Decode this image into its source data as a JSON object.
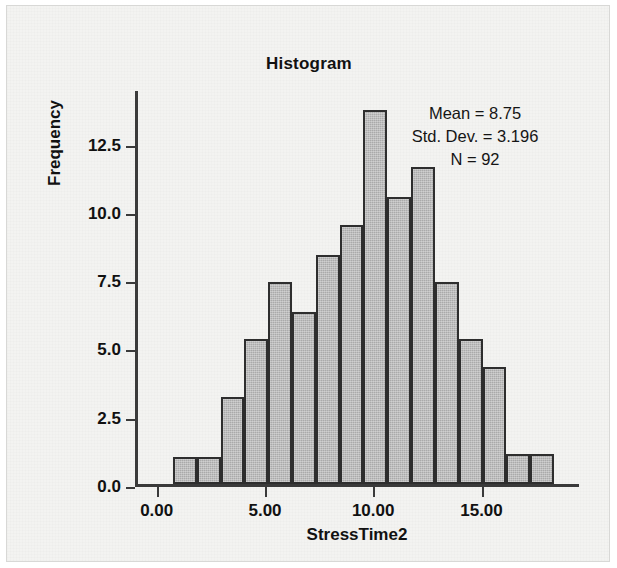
{
  "figure": {
    "title": "Histogram",
    "background_color": "#f3f3f1",
    "bar_fill_color": "#aaaaaa",
    "bar_border_color": "#2e2e2e",
    "axis_color": "#3a3a3a"
  },
  "stats": {
    "mean": "Mean = 8.75",
    "std_dev": "Std. Dev. = 3.196",
    "n": "N = 92"
  },
  "chart_data": {
    "type": "bar",
    "title": "Histogram",
    "xlabel": "StressTime2",
    "ylabel": "Frequency",
    "xlim": [
      -1.0,
      19.5
    ],
    "ylim": [
      0,
      14.5
    ],
    "xticks": [
      0,
      5,
      10,
      15
    ],
    "xtick_labels": [
      "0.00",
      "5.00",
      "10.00",
      "15.00"
    ],
    "yticks": [
      0.0,
      2.5,
      5.0,
      7.5,
      10.0,
      12.5
    ],
    "ytick_labels": [
      "0.0",
      "2.5",
      "5.0",
      "7.5",
      "10.0",
      "12.5"
    ],
    "grid": false,
    "legend": "none",
    "bin_width": 1.105,
    "bin_centers": [
      1.3,
      2.4,
      3.5,
      4.6,
      5.7,
      6.8,
      7.9,
      9.0,
      10.1,
      11.2,
      12.3,
      13.4,
      14.5,
      15.6,
      16.7,
      17.8
    ],
    "categories": [
      "1.3",
      "2.4",
      "3.5",
      "4.6",
      "5.7",
      "6.8",
      "7.9",
      "9.0",
      "10.1",
      "11.2",
      "12.3",
      "13.4",
      "14.5",
      "15.6",
      "16.7",
      "17.8"
    ],
    "values": [
      1.0,
      1.0,
      3.2,
      5.3,
      7.4,
      6.3,
      8.4,
      9.5,
      13.7,
      10.5,
      11.6,
      7.4,
      5.3,
      4.3,
      1.1,
      1.1
    ],
    "annotations": [
      "Mean = 8.75",
      "Std. Dev. = 3.196",
      "N = 92"
    ]
  }
}
